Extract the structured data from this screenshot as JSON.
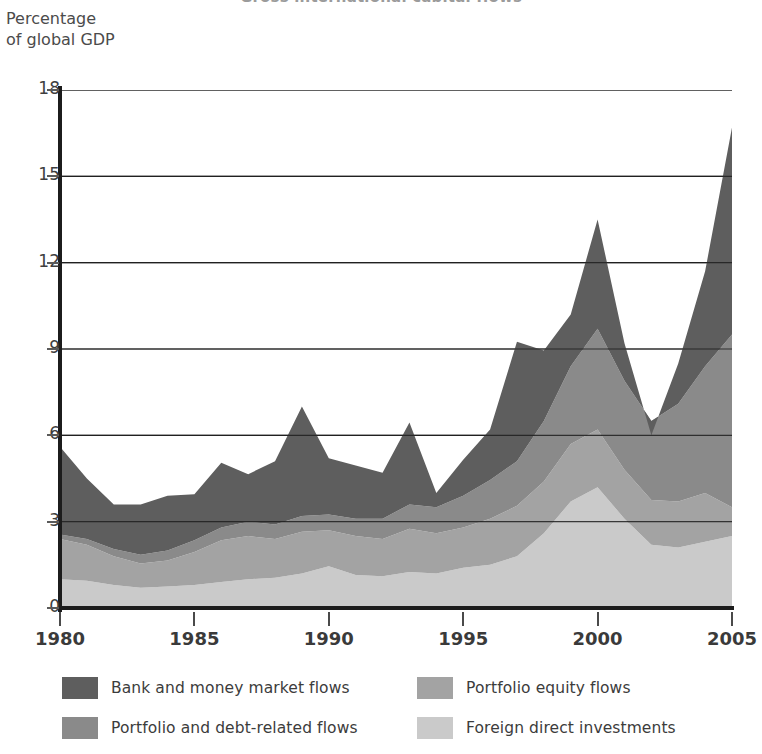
{
  "chart_data": {
    "type": "area",
    "stacked": true,
    "title": "Gross international capital flows",
    "xlabel": "",
    "ylabel": "Percentage\nof global GDP",
    "x": [
      1980,
      1981,
      1982,
      1983,
      1984,
      1985,
      1986,
      1987,
      1988,
      1989,
      1990,
      1991,
      1992,
      1993,
      1994,
      1995,
      1996,
      1997,
      1998,
      1999,
      2000,
      2001,
      2002,
      2003,
      2004,
      2005
    ],
    "xlim": [
      1980,
      2005
    ],
    "ylim": [
      0,
      18
    ],
    "yticks": [
      0,
      3,
      6,
      9,
      12,
      15,
      18
    ],
    "xticks": [
      1980,
      1985,
      1990,
      1995,
      2000,
      2005
    ],
    "grid": true,
    "legend_position": "bottom",
    "series": [
      {
        "name": "Foreign direct investments",
        "color": "#cacaca",
        "values": [
          1.0,
          0.95,
          0.8,
          0.7,
          0.75,
          0.8,
          0.9,
          1.0,
          1.05,
          1.2,
          1.45,
          1.15,
          1.1,
          1.25,
          1.2,
          1.4,
          1.5,
          1.8,
          2.6,
          3.7,
          4.2,
          3.1,
          2.2,
          2.1,
          2.3,
          2.5
        ]
      },
      {
        "name": "Portfolio equity flows",
        "color": "#a3a3a3",
        "values": [
          1.4,
          1.25,
          1.0,
          0.85,
          0.9,
          1.15,
          1.45,
          1.5,
          1.35,
          1.45,
          1.25,
          1.35,
          1.3,
          1.5,
          1.4,
          1.4,
          1.6,
          1.75,
          1.8,
          2.0,
          2.0,
          1.7,
          1.55,
          1.6,
          1.7,
          1.0
        ]
      },
      {
        "name": "Portfolio and debt-related flows",
        "color": "#8a8a8a",
        "values": [
          0.15,
          0.2,
          0.25,
          0.3,
          0.35,
          0.4,
          0.45,
          0.5,
          0.5,
          0.55,
          0.55,
          0.6,
          0.7,
          0.85,
          0.9,
          1.1,
          1.35,
          1.55,
          2.1,
          2.7,
          3.5,
          3.1,
          2.75,
          3.4,
          4.4,
          6.0
        ]
      },
      {
        "name": "Bank and money market flows",
        "color": "#5e5e5e",
        "values": [
          3.05,
          2.1,
          1.55,
          1.75,
          1.9,
          1.6,
          2.25,
          1.65,
          2.2,
          3.8,
          1.95,
          1.85,
          1.6,
          2.85,
          0.5,
          1.25,
          1.75,
          4.15,
          2.45,
          1.8,
          3.8,
          1.3,
          -0.5,
          1.4,
          3.3,
          7.2
        ]
      }
    ],
    "stack_tops": {
      "total": [
        5.6,
        4.5,
        3.6,
        3.6,
        3.9,
        3.95,
        5.05,
        4.65,
        5.1,
        7.0,
        5.2,
        4.95,
        4.7,
        6.45,
        4.0,
        5.15,
        6.2,
        9.25,
        8.95,
        10.2,
        13.5,
        9.2,
        6.0,
        8.5,
        11.7,
        16.7
      ]
    }
  },
  "yaxis": {
    "title_line1": "Percentage",
    "title_line2": "of global GDP",
    "ticks": [
      "18",
      "15",
      "12",
      "9",
      "6",
      "3",
      "0"
    ]
  },
  "xaxis": {
    "ticks": [
      "1980",
      "1985",
      "1990",
      "1995",
      "2000",
      "2005"
    ]
  },
  "legend": {
    "items": [
      {
        "label": "Bank and money market flows",
        "color": "#5e5e5e"
      },
      {
        "label": "Portfolio equity flows",
        "color": "#a3a3a3"
      },
      {
        "label": "Portfolio and debt-related flows",
        "color": "#8a8a8a"
      },
      {
        "label": "Foreign direct investments",
        "color": "#cacaca"
      }
    ]
  },
  "title": "Gross international capital flows"
}
